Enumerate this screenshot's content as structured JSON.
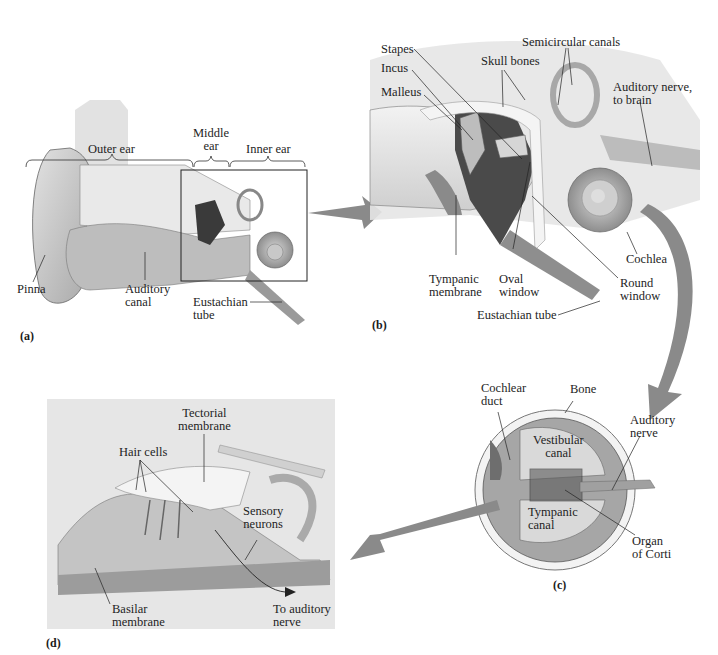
{
  "figure": {
    "panels": [
      {
        "id": "a",
        "label": "(a)",
        "title": "Outer, middle and inner ear overview",
        "region_labels": {
          "outer": "Outer ear",
          "middle": "Middle\near",
          "inner": "Inner ear"
        },
        "callouts": [
          "Pinna",
          "Auditory\ncanal",
          "Eustachian\ntube"
        ]
      },
      {
        "id": "b",
        "label": "(b)",
        "title": "Middle and inner ear detail",
        "callouts": [
          "Stapes",
          "Incus",
          "Malleus",
          "Skull bones",
          "Semicircular canals",
          "Auditory nerve,\nto brain",
          "Tympanic\nmembrane",
          "Oval\nwindow",
          "Round\nwindow",
          "Cochlea",
          "Eustachian tube"
        ]
      },
      {
        "id": "c",
        "label": "(c)",
        "title": "Cochlea cross-section",
        "callouts": [
          "Cochlear\nduct",
          "Bone",
          "Vestibular\ncanal",
          "Auditory\nnerve",
          "Tympanic\ncanal",
          "Organ\nof Corti"
        ]
      },
      {
        "id": "d",
        "label": "(d)",
        "title": "Organ of Corti detail",
        "callouts": [
          "Tectorial\nmembrane",
          "Hair cells",
          "Sensory\nneurons",
          "Basilar\nmembrane",
          "To auditory\nnerve"
        ]
      }
    ],
    "arrow_color": "#8a8a8a",
    "panel_d_background": "#e6e6e6"
  }
}
